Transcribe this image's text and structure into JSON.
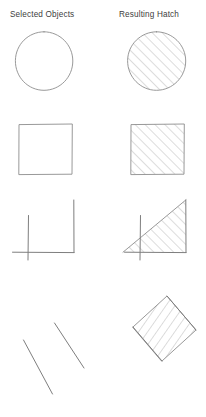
{
  "page": {
    "background_color": "#ffffff",
    "width": 206,
    "height": 417,
    "stroke_color": "#8d8d8d",
    "hatch_color": "#a2a2a2"
  },
  "columns": {
    "left_header": "Selected Objects",
    "right_header": "Resulting Hatch"
  },
  "rows": [
    {
      "index": 1,
      "selected_object_name": "circle",
      "result_name": "hatched-circle",
      "hatch_angle_degrees": 45,
      "hatch_spacing_px": 7
    },
    {
      "index": 2,
      "selected_object_name": "square",
      "result_name": "hatched-square",
      "hatch_angle_degrees": 45,
      "hatch_spacing_px": 7
    },
    {
      "index": 3,
      "selected_object_name": "open-polyline-three-segments",
      "result_name": "hatched-triangle",
      "hatch_angle_degrees": 45,
      "hatch_spacing_px": 7
    },
    {
      "index": 4,
      "selected_object_name": "two-parallel-lines",
      "result_name": "hatched-parallelogram",
      "hatch_angle_degrees": 125,
      "hatch_spacing_px": 7
    }
  ]
}
